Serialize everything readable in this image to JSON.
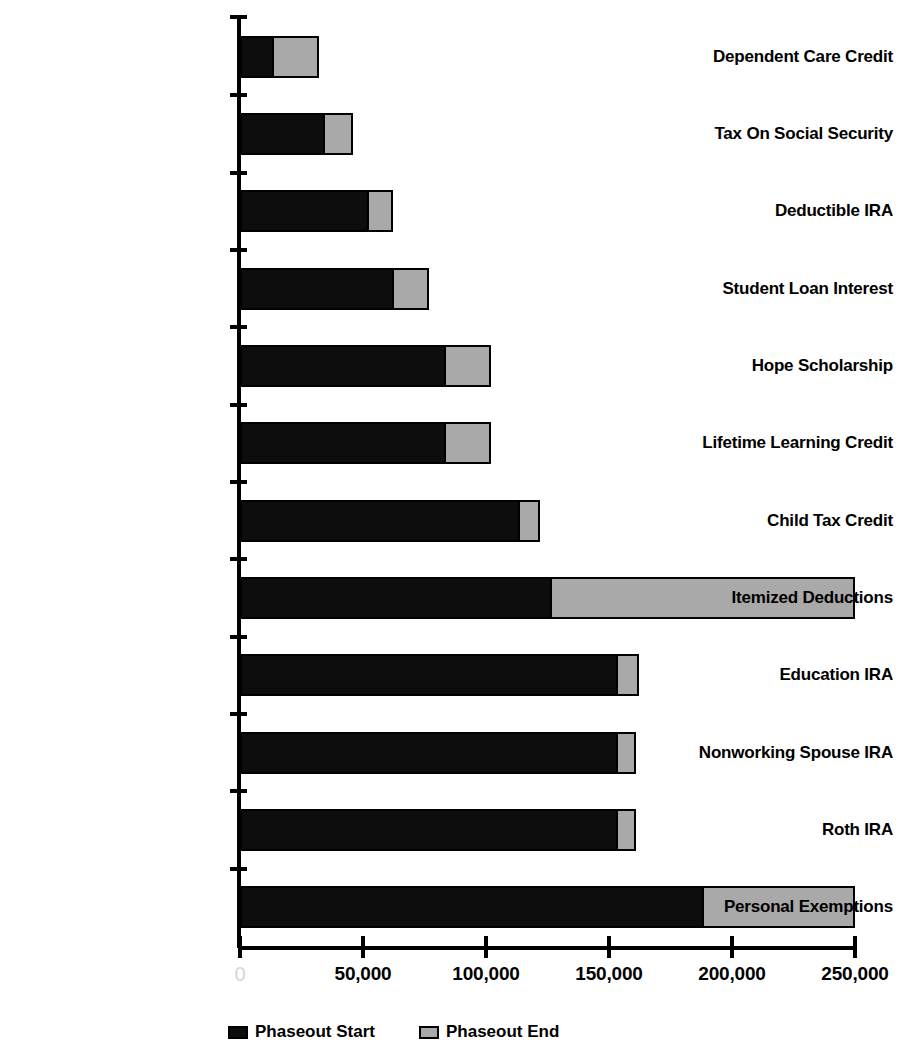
{
  "chart_data": {
    "type": "bar",
    "orientation": "horizontal",
    "stacked": true,
    "title": "",
    "xlabel": "",
    "ylabel": "",
    "xlim": [
      0,
      250000
    ],
    "grid": false,
    "legend_position": "bottom",
    "x_ticks": [
      0,
      50000,
      100000,
      150000,
      200000,
      250000
    ],
    "x_tick_labels": [
      "0",
      "50,000",
      "100,000",
      "150,000",
      "200,000",
      "250,000"
    ],
    "categories": [
      "Dependent Care Credit",
      "Tax On Social Security",
      "Deductible IRA",
      "Student Loan Interest",
      "Hope Scholarship",
      "Lifetime Learning Credit",
      "Child Tax Credit",
      "Itemized Deductions",
      "Education IRA",
      "Nonworking Spouse IRA",
      "Roth IRA",
      "Personal Exemptions"
    ],
    "series": [
      {
        "name": "Phaseout Start",
        "color": "#0d0d0d",
        "values": [
          12000,
          33000,
          51000,
          61000,
          82000,
          82000,
          112000,
          125000,
          152000,
          152000,
          152000,
          187000
        ]
      },
      {
        "name": "Phaseout End",
        "color": "#a9a9a9",
        "values": [
          20000,
          13000,
          11000,
          16000,
          20000,
          20000,
          10000,
          125000,
          10000,
          9000,
          9000,
          63000
        ]
      }
    ],
    "totals": [
      32000,
      46000,
      62000,
      77000,
      102000,
      102000,
      122000,
      250000,
      162000,
      161000,
      161000,
      250000
    ]
  },
  "legend": {
    "items": [
      {
        "label": "Phaseout Start",
        "color": "#0d0d0d"
      },
      {
        "label": "Phaseout End",
        "color": "#a9a9a9"
      }
    ]
  },
  "colors": {
    "dark": "#0d0d0d",
    "light": "#a9a9a9",
    "axis": "#000000",
    "background": "#ffffff"
  }
}
